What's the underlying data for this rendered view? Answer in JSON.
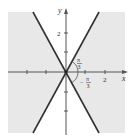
{
  "figure": {
    "axes": {
      "x_label": "x",
      "y_label": "y",
      "x_tick_label": "2",
      "y_tick_label": "2"
    },
    "angle_labels": {
      "positive": {
        "num": "π",
        "den": "3"
      },
      "negative": {
        "sign": "−",
        "num": "π",
        "den": "3"
      }
    },
    "colors": {
      "shade": "#e8e8e8",
      "lines": "#333333",
      "axes": "#555555"
    }
  }
}
